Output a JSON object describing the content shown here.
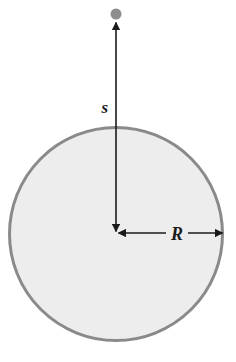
{
  "figure": {
    "type": "physics-diagram",
    "background_color": "#ffffff",
    "labels": {
      "distance_label": "s",
      "radius_label": "R"
    },
    "shapes": {
      "sphere": {
        "name": "uniform-sphere",
        "center_x": 116,
        "center_y": 234,
        "radius": 108,
        "fill_color": "#ededed",
        "stroke_color": "#8a8a8a",
        "stroke_width": 3
      },
      "point_mass": {
        "name": "point-mass-dot",
        "center_x": 116,
        "center_y": 14,
        "radius": 5.5,
        "fill_color": "#8d8d8d"
      },
      "distance_arrow": {
        "name": "distance-arrow-s",
        "x": 116,
        "y_top": 21,
        "y_bottom": 233,
        "stroke_color": "#1a1a1a",
        "stroke_width": 1.6,
        "arrowheads": "both"
      },
      "radius_arrow": {
        "name": "radius-arrow-R",
        "y": 233,
        "x_left": 116,
        "x_right": 224,
        "stroke_color": "#1a1a1a",
        "stroke_width": 1.6,
        "arrowheads": "both"
      }
    },
    "label_positions": {
      "s": {
        "x": 108,
        "y": 113,
        "anchor": "end"
      },
      "R": {
        "x": 176,
        "y": 240,
        "anchor": "middle"
      }
    }
  }
}
